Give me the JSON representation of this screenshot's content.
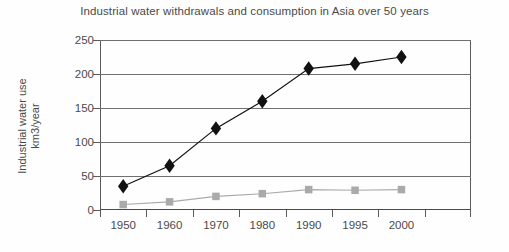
{
  "chart_data": {
    "type": "line",
    "title": "Industrial water withdrawals and consumption in Asia over 50 years",
    "xlabel": "",
    "ylabel": "Industrial water use km3/year",
    "ylabel_line1": "Industrial water use",
    "ylabel_line2": "km3/year",
    "categories": [
      "1950",
      "1960",
      "1970",
      "1980",
      "1990",
      "1995",
      "2000"
    ],
    "yticks": [
      "250",
      "200",
      "150",
      "100",
      "50",
      "0"
    ],
    "ylim": [
      0,
      250
    ],
    "grid": true,
    "legend": "none",
    "series": [
      {
        "name": "Industrial water withdrawals",
        "marker": "diamond",
        "color": "#111111",
        "values": [
          35,
          65,
          120,
          160,
          208,
          215,
          225
        ]
      },
      {
        "name": "Industrial water consumption",
        "marker": "square",
        "color": "#aaaaaa",
        "values": [
          8,
          12,
          20,
          24,
          30,
          29,
          30
        ]
      }
    ]
  },
  "colors": {
    "series_dark": "#111111",
    "series_light": "#aaaaaa",
    "axis": "#5a5a5a",
    "grid": "#6f6f6f",
    "text": "#4a4a4a",
    "background": "#fefefe"
  }
}
